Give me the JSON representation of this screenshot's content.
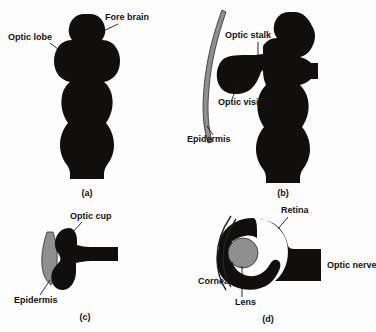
{
  "figure": {
    "background_color": "#fdfdfd",
    "ink_color": "#100f0d",
    "tissue_color": "#8f8f8f",
    "panels": [
      {
        "id": "a",
        "letter": "(a)",
        "labels": [
          {
            "name": "optic-lobe",
            "text": "Optic lobe"
          },
          {
            "name": "fore-brain",
            "text": "Fore brain"
          }
        ]
      },
      {
        "id": "b",
        "letter": "(b)",
        "labels": [
          {
            "name": "optic-stalk",
            "text": "Optic stalk"
          },
          {
            "name": "optic-visicle",
            "text": "Optic visicle"
          },
          {
            "name": "epidermis",
            "text": "Epidermis"
          }
        ]
      },
      {
        "id": "c",
        "letter": "(c)",
        "labels": [
          {
            "name": "optic-cup",
            "text": "Optic cup"
          },
          {
            "name": "epidermis",
            "text": "Epidermis"
          }
        ]
      },
      {
        "id": "d",
        "letter": "(d)",
        "labels": [
          {
            "name": "retina",
            "text": "Retina"
          },
          {
            "name": "optic-nerve",
            "text": "Optic nerve"
          },
          {
            "name": "cornea",
            "text": "Cornea"
          },
          {
            "name": "lens",
            "text": "Lens"
          }
        ]
      }
    ]
  },
  "panel_a": {
    "label_optic_lobe": "Optic lobe",
    "label_fore_brain": "Fore brain",
    "letter": "(a)"
  },
  "panel_b": {
    "label_optic_stalk": "Optic stalk",
    "label_optic_visicle": "Optic visicle",
    "label_epidermis": "Epidermis",
    "letter": "(b)"
  },
  "panel_c": {
    "label_optic_cup": "Optic cup",
    "label_epidermis": "Epidermis",
    "letter": "(c)"
  },
  "panel_d": {
    "label_retina": "Retina",
    "label_optic_nerve": "Optic nerve",
    "label_cornea": "Cornea",
    "label_lens": "Lens",
    "letter": "(d)"
  }
}
